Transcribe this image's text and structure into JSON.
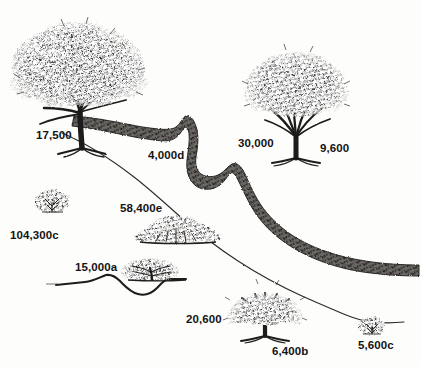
{
  "figure": {
    "type": "landscape-illustration",
    "medium": "pen-and-ink hatched drawing",
    "background_color": "#fdfdfc",
    "ink_color": "#2b2b2b",
    "width": 421,
    "height": 367
  },
  "features": {
    "band": {
      "name": "thick-textured-diagonal-band",
      "description": "broad stippled band running from upper-left to right edge"
    },
    "contour": {
      "name": "thin-contour-line",
      "description": "thin line running roughly parallel below the band"
    },
    "ground_contour": {
      "name": "ground-profile-line",
      "description": "low ground profile with a dip at lower left"
    }
  },
  "labels": [
    {
      "id": "l1",
      "text": "17,500",
      "x": 36,
      "y": 130,
      "subject": "large-spreading-tree"
    },
    {
      "id": "l2",
      "text": "4,000d",
      "x": 148,
      "y": 150,
      "subject": "band-segment"
    },
    {
      "id": "l3",
      "text": "30,000",
      "x": 238,
      "y": 138,
      "subject": "vase-shaped-tree"
    },
    {
      "id": "l4",
      "text": "9,600",
      "x": 320,
      "y": 143,
      "subject": "vase-shaped-tree"
    },
    {
      "id": "l5",
      "text": "104,300c",
      "x": 10,
      "y": 230,
      "subject": "small-shrub-left"
    },
    {
      "id": "l6",
      "text": "58,400e",
      "x": 120,
      "y": 203,
      "subject": "low-thicket"
    },
    {
      "id": "l7",
      "text": "15,000a",
      "x": 75,
      "y": 262,
      "subject": "ground-profile"
    },
    {
      "id": "l8",
      "text": "20,600",
      "x": 186,
      "y": 314,
      "subject": "medium-tree-bottom"
    },
    {
      "id": "l9",
      "text": "6,400b",
      "x": 272,
      "y": 346,
      "subject": "medium-tree-bottom"
    },
    {
      "id": "l10",
      "text": "5,600c",
      "x": 358,
      "y": 340,
      "subject": "small-shrub-right"
    }
  ],
  "vegetation": [
    {
      "id": "v1",
      "name": "large-spreading-tree",
      "label": "17,500"
    },
    {
      "id": "v2",
      "name": "vase-shaped-tree",
      "label": "30,000"
    },
    {
      "id": "v3",
      "name": "small-shrub-left",
      "label": "104,300c"
    },
    {
      "id": "v4",
      "name": "low-thicket",
      "label": "58,400e"
    },
    {
      "id": "v5",
      "name": "low-spreading-shrub",
      "label": "15,000a"
    },
    {
      "id": "v6",
      "name": "medium-tree-bottom",
      "label": "6,400b"
    },
    {
      "id": "v7",
      "name": "small-shrub-right",
      "label": "5,600c"
    }
  ]
}
